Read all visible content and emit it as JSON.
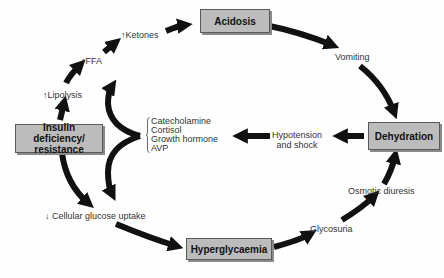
{
  "diagram": {
    "type": "cycle-flowchart",
    "boxes": {
      "acidosis": "Acidosis",
      "dehydration": "Dehydration",
      "hyperglycaemia": "Hyperglycaemia",
      "insulin_line1": "Insulin deficiency/",
      "insulin_line2": "resistance"
    },
    "labels": {
      "ketones": "↑Ketones",
      "ffa": "↑FFA",
      "lipolysis": "↑Lipolysis",
      "vomiting": "Vomiting",
      "hypotension_line1": "Hypotension",
      "hypotension_line2": "and shock",
      "osmotic_diuresis": "Osmotic diuresis",
      "glycosuria": "Glycosuria",
      "cellular_glucose_uptake": "↓ Cellular glucose uptake"
    },
    "hormones": [
      "Catecholamine",
      "Cortisol",
      "Growth hormone",
      "AVP"
    ],
    "colors": {
      "box_fill": "#bcbcbc",
      "box_border": "#5a5a5a",
      "arrow": "#111111",
      "background": "#fefefe"
    },
    "edges": [
      {
        "from": "Insulin deficiency/resistance",
        "to": "↑Lipolysis"
      },
      {
        "from": "↑Lipolysis",
        "to": "↑FFA"
      },
      {
        "from": "↑FFA",
        "to": "↑Ketones"
      },
      {
        "from": "↑Ketones",
        "to": "Acidosis"
      },
      {
        "from": "Acidosis",
        "to": "Vomiting"
      },
      {
        "from": "Vomiting",
        "to": "Dehydration"
      },
      {
        "from": "Dehydration",
        "to": "Hypotension and shock"
      },
      {
        "from": "Hypotension and shock",
        "to": "Catecholamine/Cortisol/Growth hormone/AVP"
      },
      {
        "from": "Catecholamine/Cortisol/Growth hormone/AVP",
        "to": "↑FFA"
      },
      {
        "from": "Catecholamine/Cortisol/Growth hormone/AVP",
        "to": "↓ Cellular glucose uptake"
      },
      {
        "from": "Insulin deficiency/resistance",
        "to": "↓ Cellular glucose uptake"
      },
      {
        "from": "↓ Cellular glucose uptake",
        "to": "Hyperglycaemia"
      },
      {
        "from": "Hyperglycaemia",
        "to": "Glycosuria"
      },
      {
        "from": "Glycosuria",
        "to": "Osmotic diuresis"
      },
      {
        "from": "Osmotic diuresis",
        "to": "Dehydration"
      }
    ]
  }
}
